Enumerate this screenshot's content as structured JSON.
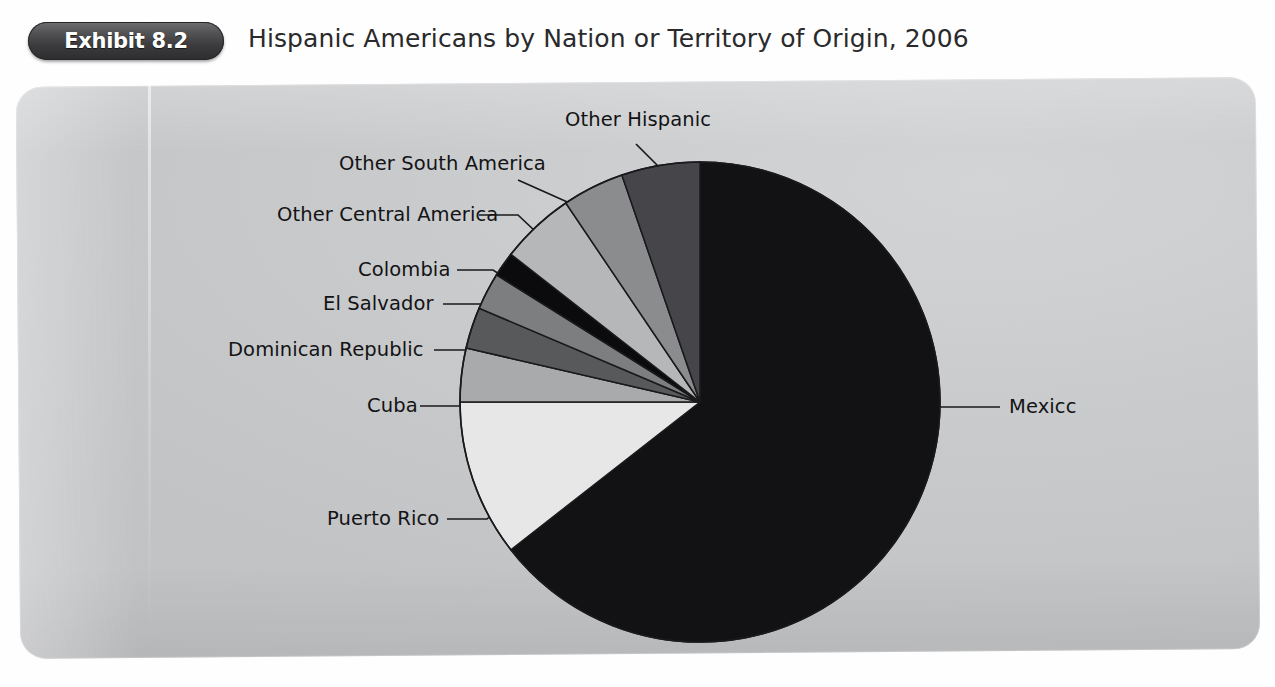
{
  "header": {
    "badge_label": "Exhibit 8.2",
    "title": "Hispanic Americans by Nation or Territory of Origin, 2006"
  },
  "labels": {
    "other_hispanic": "Other Hispanic",
    "other_south_america": "Other South America",
    "other_central_america": "Other Central America",
    "colombia": "Colombia",
    "el_salvador": "El  Salvador",
    "dominican_republic": "Dominican Republic",
    "cuba": "Cuba",
    "puerto_rico": "Puerto Rico",
    "mexico": "Mexicc"
  },
  "colors": {
    "panel_background": "#c6c7c9",
    "page_background": "#ffffff",
    "badge_dark": "#3b3b3d",
    "text": "#131315",
    "slice_outline": "#1a1a1c"
  },
  "chart_data": {
    "type": "pie",
    "title": "Hispanic Americans by Nation or Territory of Origin, 2006",
    "xlabel": "",
    "ylabel": "",
    "grid": false,
    "legend_position": "none",
    "labels_position": "leader-lines-outside",
    "start_angle_deg_from_12oclock": 0,
    "direction": "clockwise",
    "units": "percent of Hispanic American population",
    "center_px": [
      700,
      402
    ],
    "radius_px": 240,
    "categories": [
      "Mexicc",
      "Puerto Rico",
      "Cuba",
      "Dominican Republic",
      "El  Salvador",
      "Colombia",
      "Other Central America",
      "Other South America",
      "Other Hispanic"
    ],
    "values": [
      64.4,
      9.6,
      3.7,
      2.8,
      2.5,
      1.6,
      5.0,
      4.1,
      6.3
    ],
    "slices": [
      {
        "label": "Mexicc",
        "value": 64.4,
        "start_deg": 0,
        "end_deg": 232,
        "fill": "#121214"
      },
      {
        "label": "Puerto Rico",
        "value": 9.6,
        "start_deg": 232,
        "end_deg": 270,
        "fill": "#e6e7e6"
      },
      {
        "label": "Cuba",
        "value": 3.7,
        "start_deg": 270,
        "end_deg": 283,
        "fill": "#a9aaac"
      },
      {
        "label": "Dominican Republic",
        "value": 2.8,
        "start_deg": 283,
        "end_deg": 293,
        "fill": "#58595b"
      },
      {
        "label": "El  Salvador",
        "value": 2.5,
        "start_deg": 293,
        "end_deg": 302,
        "fill": "#7d7e80"
      },
      {
        "label": "Colombia",
        "value": 1.6,
        "start_deg": 302,
        "end_deg": 308,
        "fill": "#0b0b0d"
      },
      {
        "label": "Other Central America",
        "value": 5.0,
        "start_deg": 308,
        "end_deg": 326,
        "fill": "#b6b7b9"
      },
      {
        "label": "Other South America",
        "value": 4.1,
        "start_deg": 326,
        "end_deg": 341,
        "fill": "#8b8c8e"
      },
      {
        "label": "Other Hispanic",
        "value": 6.3,
        "start_deg": 341,
        "end_deg": 360,
        "fill": "#46464a"
      }
    ]
  }
}
